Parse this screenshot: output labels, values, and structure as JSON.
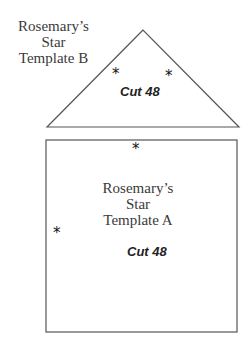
{
  "template_b": {
    "title_line1": "Rosemary’s",
    "title_line2": "Star",
    "title_line3": "Template B",
    "cut_label": "Cut 48",
    "star_glyph": "*"
  },
  "template_a": {
    "title_line1": "Rosemary’s",
    "title_line2": "Star",
    "title_line3": "Template A",
    "cut_label": "Cut 48",
    "star_glyph": "*"
  },
  "colors": {
    "outline": "#555555",
    "text": "#3a3a3a"
  }
}
